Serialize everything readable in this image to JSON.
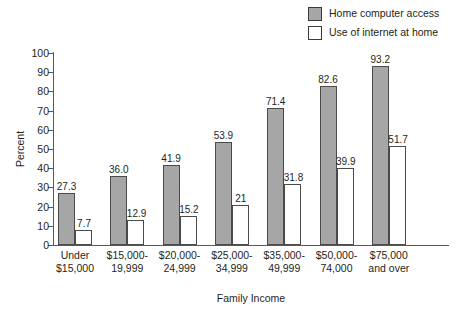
{
  "chart_data": {
    "type": "bar",
    "title": "",
    "xlabel": "Family Income",
    "ylabel": "Percent",
    "ylim": [
      0,
      100
    ],
    "yticks": [
      0,
      10,
      20,
      30,
      40,
      50,
      60,
      70,
      80,
      90,
      100
    ],
    "grid": false,
    "legend_position": "top-right",
    "categories": [
      "Under $15,000",
      "$15,000-19,999",
      "$20,000-24,999",
      "$25,000-34,999",
      "$35,000-49,999",
      "$50,000-74,000",
      "$75,000 and over"
    ],
    "category_lines": [
      [
        "Under",
        "$15,000"
      ],
      [
        "$15,000-",
        "19,999"
      ],
      [
        "$20,000-",
        "24,999"
      ],
      [
        "$25,000-",
        "34,999"
      ],
      [
        "$35,000-",
        "49,999"
      ],
      [
        "$50,000-",
        "74,000"
      ],
      [
        "$75,000",
        "and over"
      ]
    ],
    "series": [
      {
        "name": "Home computer access",
        "color": "#a6a6a6",
        "values": [
          27.3,
          36.0,
          41.9,
          53.9,
          71.4,
          82.6,
          93.2
        ],
        "labels": [
          "27.3",
          "36.0",
          "41.9",
          "53.9",
          "71.4",
          "82.6",
          "93.2"
        ]
      },
      {
        "name": "Use of internet at home",
        "color": "#ffffff",
        "values": [
          7.7,
          12.9,
          15.2,
          21,
          31.8,
          39.9,
          51.7
        ],
        "labels": [
          "7.7",
          "12.9",
          "15.2",
          "21",
          "31.8",
          "39.9",
          "51.7"
        ]
      }
    ]
  },
  "legend": {
    "items": [
      {
        "label": "Home computer access",
        "color": "#a6a6a6"
      },
      {
        "label": "Use of internet at home",
        "color": "#ffffff"
      }
    ]
  },
  "axes": {
    "y_title": "Percent",
    "x_title": "Family Income",
    "y_tick_labels": [
      "0",
      "10",
      "20",
      "30",
      "40",
      "50",
      "60",
      "70",
      "80",
      "90",
      "100"
    ]
  }
}
